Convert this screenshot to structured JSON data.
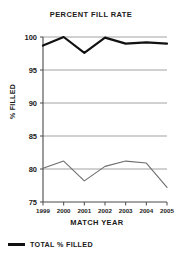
{
  "chart_data": {
    "type": "line",
    "title": "PERCENT FILL RATE",
    "xlabel": "MATCH YEAR",
    "ylabel": "% FILLED",
    "categories": [
      "1999",
      "2000",
      "2001",
      "2002",
      "2003",
      "2004",
      "2005"
    ],
    "x": [
      1999,
      2000,
      2001,
      2002,
      2003,
      2004,
      2005
    ],
    "ylim": [
      75,
      100
    ],
    "yticks": [
      75,
      80,
      85,
      90,
      95,
      100
    ],
    "ytick_labels": [
      "75",
      "80",
      "85",
      "90",
      "95",
      "100"
    ],
    "grid": true,
    "grid_axis": "y",
    "legend_position": "below-plot-left",
    "series": [
      {
        "name": "TOTAL % FILLED",
        "color": "#111111",
        "width": 2.2,
        "in_legend": true,
        "values": [
          98.7,
          100.0,
          97.6,
          99.9,
          99.0,
          99.2,
          99.0
        ]
      },
      {
        "name": "secondary-series",
        "color": "#6e6e6e",
        "width": 1.1,
        "in_legend": false,
        "values": [
          80.1,
          81.2,
          78.2,
          80.4,
          81.2,
          80.9,
          77.2
        ]
      }
    ]
  },
  "legend": {
    "entries": [
      {
        "label": "TOTAL % FILLED",
        "color": "#111111"
      }
    ]
  },
  "colors": {
    "primary_line": "#111111",
    "secondary_line": "#6e6e6e",
    "gridline": "#8c8c8c",
    "axis": "#4a4a4a",
    "text": "#1a1a1a",
    "background": "#ffffff"
  }
}
